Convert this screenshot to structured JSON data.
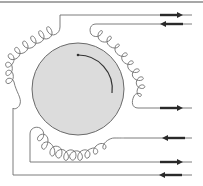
{
  "diagram": {
    "title": "",
    "colors": {
      "background": "#ffffff",
      "rotor_fill": "#dcdcdc",
      "rotor_stroke": "#6a6a6a",
      "wire": "#6e6e6e",
      "arrow": "#2a2a2a",
      "border": "#8a8a8a"
    },
    "rotor": {
      "cx": 78,
      "cy": 89,
      "r": 46,
      "rotation": "clockwise"
    },
    "leads": [
      {
        "id": "lead-1",
        "y": 15,
        "direction": "out"
      },
      {
        "id": "lead-2",
        "y": 24,
        "direction": "in"
      },
      {
        "id": "lead-3",
        "y": 108,
        "direction": "out"
      },
      {
        "id": "lead-4",
        "y": 138,
        "direction": "in"
      },
      {
        "id": "lead-5",
        "y": 162,
        "direction": "out"
      },
      {
        "id": "lead-6",
        "y": 175,
        "direction": "in"
      }
    ],
    "coils": [
      {
        "id": "coil-left",
        "position": "upper-left"
      },
      {
        "id": "coil-right",
        "position": "right"
      },
      {
        "id": "coil-bottom",
        "position": "bottom"
      }
    ]
  }
}
